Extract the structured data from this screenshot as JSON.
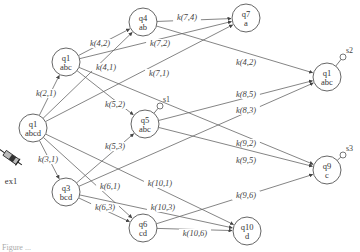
{
  "diagram": {
    "nodes": [
      {
        "id": "n_abcd",
        "name": "q1",
        "label": "abcd",
        "x": 33,
        "y": 128
      },
      {
        "id": "n_abc_l",
        "name": "q1",
        "label": "abc",
        "x": 66,
        "y": 62
      },
      {
        "id": "n_ab",
        "name": "q4",
        "label": "ab",
        "x": 143,
        "y": 22
      },
      {
        "id": "n_a",
        "name": "q7",
        "label": "a",
        "x": 246,
        "y": 18
      },
      {
        "id": "n_abc_m",
        "name": "q5",
        "label": "abc",
        "x": 145,
        "y": 124
      },
      {
        "id": "n_bcd",
        "name": "q3",
        "label": "bcd",
        "x": 66,
        "y": 192
      },
      {
        "id": "n_cd",
        "name": "q6",
        "label": "cd",
        "x": 143,
        "y": 228
      },
      {
        "id": "n_d",
        "name": "q10",
        "label": "d",
        "x": 247,
        "y": 231
      },
      {
        "id": "n_abc_r",
        "name": "q1",
        "label": "abc",
        "x": 327,
        "y": 77
      },
      {
        "id": "n_c",
        "name": "q9",
        "label": "c",
        "x": 327,
        "y": 170
      }
    ],
    "edges": [
      {
        "from": "n_abcd",
        "to": "n_abc_l",
        "label": "k(2,1)",
        "lx": 46,
        "ly": 93
      },
      {
        "from": "n_abcd",
        "to": "n_ab",
        "label": "k(4,1)",
        "lx": 106,
        "ly": 67
      },
      {
        "from": "n_abcd",
        "to": "n_a",
        "label": "k(7,1)",
        "lx": 159,
        "ly": 73
      },
      {
        "from": "n_abcd",
        "to": "n_bcd",
        "label": "k(3,1)",
        "lx": 48,
        "ly": 159
      },
      {
        "from": "n_abcd",
        "to": "n_cd",
        "label": "k(6,1)",
        "lx": 110,
        "ly": 186
      },
      {
        "from": "n_abcd",
        "to": "n_d",
        "label": "k(10,1)",
        "lx": 160,
        "ly": 183
      },
      {
        "from": "n_abc_l",
        "to": "n_ab",
        "label": "k(4,2)",
        "lx": 100,
        "ly": 43
      },
      {
        "from": "n_abc_l",
        "to": "n_a",
        "label": "k(7,2)",
        "lx": 160,
        "ly": 43
      },
      {
        "from": "n_abc_l",
        "to": "n_abc_m",
        "label": "k(5,2)",
        "lx": 115,
        "ly": 104
      },
      {
        "from": "n_abc_l",
        "to": "n_c",
        "label": "k(9,2)",
        "lx": 246,
        "ly": 143
      },
      {
        "from": "n_ab",
        "to": "n_a",
        "label": "k(7,4)",
        "lx": 187,
        "ly": 17
      },
      {
        "from": "n_ab",
        "to": "n_abc_r",
        "label": "k(4,2)",
        "lx": 246,
        "ly": 62
      },
      {
        "from": "n_abc_m",
        "to": "n_abc_r",
        "label": "k(8,5)",
        "lx": 246,
        "ly": 94
      },
      {
        "from": "n_abc_m",
        "to": "n_c",
        "label": "k(9,5)",
        "lx": 246,
        "ly": 160
      },
      {
        "from": "n_bcd",
        "to": "n_abc_m",
        "label": "k(5,3)",
        "lx": 115,
        "ly": 146
      },
      {
        "from": "n_bcd",
        "to": "n_abc_r",
        "label": "k(8,3)",
        "lx": 246,
        "ly": 110
      },
      {
        "from": "n_bcd",
        "to": "n_cd",
        "label": "k(6,3)",
        "lx": 105,
        "ly": 207
      },
      {
        "from": "n_bcd",
        "to": "n_d",
        "label": "k(10,3)",
        "lx": 163,
        "ly": 207
      },
      {
        "from": "n_cd",
        "to": "n_c",
        "label": "k(9,6)",
        "lx": 246,
        "ly": 195
      },
      {
        "from": "n_cd",
        "to": "n_d",
        "label": "k(10,6)",
        "lx": 195,
        "ly": 233
      }
    ],
    "sinks": [
      {
        "node": "n_abc_m",
        "label": "s1",
        "x": 160,
        "y": 106
      },
      {
        "node": "n_abc_r",
        "label": "s2",
        "x": 343,
        "y": 57
      },
      {
        "node": "n_c",
        "label": "s3",
        "x": 343,
        "y": 155
      }
    ],
    "source": {
      "label": "ex1",
      "icon": "syringe-icon"
    },
    "caption": "Figure ..."
  }
}
